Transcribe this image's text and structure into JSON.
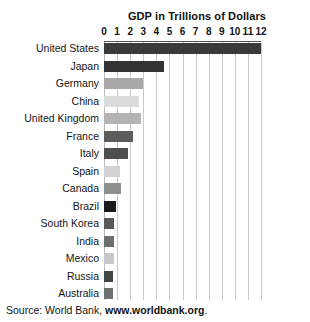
{
  "chart_data": {
    "type": "bar",
    "orientation": "horizontal",
    "title": "GDP in Trillions of Dollars",
    "xlabel": "",
    "ylabel": "",
    "xlim": [
      0,
      12
    ],
    "grid": true,
    "legend": null,
    "tick_labels": [
      "0",
      "1",
      "2",
      "3",
      "4",
      "5",
      "6",
      "7",
      "8",
      "9",
      "10",
      "11",
      "12"
    ],
    "tick_values": [
      0,
      1,
      2,
      3,
      4,
      5,
      6,
      7,
      8,
      9,
      10,
      11,
      12
    ],
    "categories": [
      "United States",
      "Japan",
      "Germany",
      "China",
      "United Kingdom",
      "France",
      "Italy",
      "Spain",
      "Canada",
      "Brazil",
      "South Korea",
      "India",
      "Mexico",
      "Russia",
      "Australia"
    ],
    "values": [
      12.0,
      4.6,
      3.0,
      2.7,
      2.8,
      2.2,
      1.8,
      1.2,
      1.3,
      0.9,
      0.8,
      0.8,
      0.75,
      0.7,
      0.7
    ],
    "bar_colors": [
      "#3a3a3a",
      "#333333",
      "#a8a8a8",
      "#dcdcdc",
      "#b4b4b4",
      "#5c5c5c",
      "#4e4e4e",
      "#d2d2d2",
      "#8e8e8e",
      "#1a1a1a",
      "#595959",
      "#6e6e6e",
      "#c8c8c8",
      "#454545",
      "#707070"
    ]
  },
  "source": {
    "prefix": "Source: World Bank, ",
    "url": "www.worldbank.org",
    "suffix": "."
  }
}
